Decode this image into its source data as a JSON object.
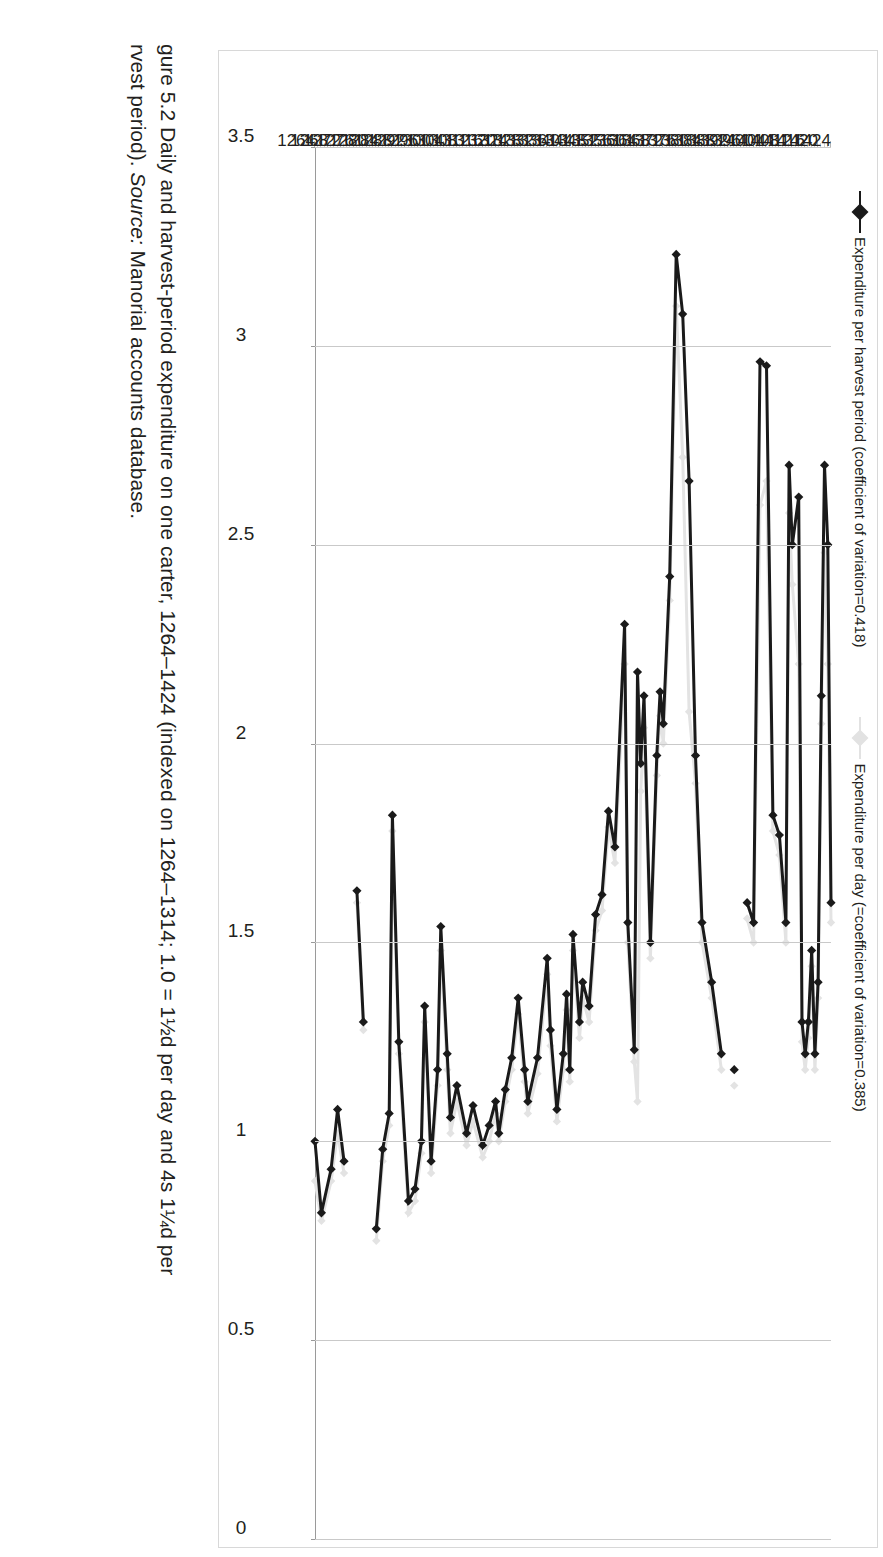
{
  "figure": {
    "caption_line1": "gure 5.2 Daily and harvest-period expenditure on one carter, 1264–1424 (indexed on 1264–1314; 1.0 = 1½d per day and 4s 1¼d per",
    "caption_line2_pre": "rvest period). ",
    "caption_source_label": "Source:",
    "caption_line2_post": " Manorial accounts database."
  },
  "chart_data": {
    "type": "line",
    "title": "",
    "xlabel": "",
    "ylabel": "",
    "orientation": "rotated-90",
    "grid": true,
    "legend_position": "top",
    "ylim": [
      0,
      3.5
    ],
    "yticks": [
      "0",
      "0.5",
      "1",
      "1.5",
      "2",
      "2.5",
      "3",
      "3.5"
    ],
    "ytick_values": [
      0,
      0.5,
      1,
      1.5,
      2,
      2.5,
      3,
      3.5
    ],
    "xlim": [
      1264,
      1424
    ],
    "xticks": [
      "1264",
      "1268",
      "1272",
      "1276",
      "1280",
      "1284",
      "1288",
      "1292",
      "1296",
      "1300",
      "1304",
      "1308",
      "1312",
      "1316",
      "1320",
      "1324",
      "1328",
      "1332",
      "1336",
      "1340",
      "1344",
      "1348",
      "1352",
      "1356",
      "1360",
      "1364",
      "1368",
      "1372",
      "1376",
      "1380",
      "1384",
      "1388",
      "1392",
      "1396",
      "1400",
      "1404",
      "1408",
      "1412",
      "1416",
      "1420",
      "1424"
    ],
    "series": [
      {
        "name": "Expenditure per harvest period (coefficient of variation=0.418)",
        "color": "#1a1a1a",
        "marker": "diamond",
        "points": [
          [
            1264,
            1.0
          ],
          [
            1266,
            0.82
          ],
          [
            1269,
            0.93
          ],
          [
            1271,
            1.08
          ],
          [
            1273,
            0.95
          ],
          [
            1277,
            1.63
          ],
          [
            1279,
            1.3
          ],
          [
            1283,
            0.78
          ],
          [
            1285,
            0.98
          ],
          [
            1287,
            1.07
          ],
          [
            1288,
            1.82
          ],
          [
            1290,
            1.25
          ],
          [
            1293,
            0.85
          ],
          [
            1295,
            0.88
          ],
          [
            1297,
            1.0
          ],
          [
            1298,
            1.34
          ],
          [
            1300,
            0.95
          ],
          [
            1302,
            1.18
          ],
          [
            1303,
            1.54
          ],
          [
            1305,
            1.22
          ],
          [
            1306,
            1.06
          ],
          [
            1308,
            1.14
          ],
          [
            1311,
            1.02
          ],
          [
            1313,
            1.09
          ],
          [
            1316,
            0.99
          ],
          [
            1318,
            1.04
          ],
          [
            1320,
            1.1
          ],
          [
            1321,
            1.02
          ],
          [
            1323,
            1.13
          ],
          [
            1325,
            1.21
          ],
          [
            1327,
            1.36
          ],
          [
            1329,
            1.18
          ],
          [
            1330,
            1.1
          ],
          [
            1333,
            1.21
          ],
          [
            1336,
            1.46
          ],
          [
            1337,
            1.28
          ],
          [
            1339,
            1.08
          ],
          [
            1341,
            1.22
          ],
          [
            1342,
            1.37
          ],
          [
            1343,
            1.18
          ],
          [
            1344,
            1.52
          ],
          [
            1346,
            1.3
          ],
          [
            1347,
            1.4
          ],
          [
            1349,
            1.34
          ],
          [
            1351,
            1.57
          ],
          [
            1353,
            1.62
          ],
          [
            1355,
            1.83
          ],
          [
            1357,
            1.74
          ],
          [
            1360,
            2.3
          ],
          [
            1361,
            1.55
          ],
          [
            1363,
            1.23
          ],
          [
            1364,
            2.18
          ],
          [
            1365,
            1.95
          ],
          [
            1366,
            2.12
          ],
          [
            1368,
            1.5
          ],
          [
            1370,
            1.97
          ],
          [
            1371,
            2.13
          ],
          [
            1372,
            2.05
          ],
          [
            1374,
            2.42
          ],
          [
            1376,
            3.23
          ],
          [
            1378,
            3.08
          ],
          [
            1380,
            2.66
          ],
          [
            1382,
            1.97
          ],
          [
            1384,
            1.55
          ],
          [
            1387,
            1.4
          ],
          [
            1390,
            1.22
          ],
          [
            1394,
            1.18
          ],
          [
            1398,
            1.6
          ],
          [
            1400,
            1.55
          ],
          [
            1402,
            2.96
          ],
          [
            1404,
            2.95
          ],
          [
            1406,
            1.82
          ],
          [
            1408,
            1.77
          ],
          [
            1410,
            1.55
          ],
          [
            1411,
            2.7
          ],
          [
            1412,
            2.5
          ],
          [
            1414,
            2.62
          ],
          [
            1415,
            1.3
          ],
          [
            1416,
            1.22
          ],
          [
            1417,
            1.3
          ],
          [
            1418,
            1.48
          ],
          [
            1419,
            1.22
          ],
          [
            1420,
            1.4
          ],
          [
            1421,
            2.12
          ],
          [
            1422,
            2.7
          ],
          [
            1423,
            2.5
          ],
          [
            1424,
            1.6
          ]
        ]
      },
      {
        "name": "Expenditure per day (=coefficient of variation=0.385)",
        "color": "#e3e3e3",
        "marker": "diamond",
        "points": [
          [
            1264,
            0.9
          ],
          [
            1266,
            0.8
          ],
          [
            1269,
            0.9
          ],
          [
            1271,
            1.02
          ],
          [
            1273,
            0.92
          ],
          [
            1277,
            1.6
          ],
          [
            1279,
            1.28
          ],
          [
            1283,
            0.75
          ],
          [
            1285,
            0.95
          ],
          [
            1287,
            1.04
          ],
          [
            1288,
            1.78
          ],
          [
            1290,
            1.22
          ],
          [
            1293,
            0.82
          ],
          [
            1295,
            0.85
          ],
          [
            1297,
            0.97
          ],
          [
            1298,
            1.3
          ],
          [
            1300,
            0.92
          ],
          [
            1302,
            1.14
          ],
          [
            1303,
            1.48
          ],
          [
            1305,
            1.18
          ],
          [
            1306,
            1.02
          ],
          [
            1308,
            1.1
          ],
          [
            1311,
            0.99
          ],
          [
            1313,
            1.05
          ],
          [
            1316,
            0.96
          ],
          [
            1318,
            1.0
          ],
          [
            1320,
            1.07
          ],
          [
            1321,
            1.0
          ],
          [
            1323,
            1.1
          ],
          [
            1325,
            1.18
          ],
          [
            1327,
            1.32
          ],
          [
            1329,
            1.15
          ],
          [
            1330,
            1.07
          ],
          [
            1333,
            1.17
          ],
          [
            1336,
            1.42
          ],
          [
            1337,
            1.24
          ],
          [
            1339,
            1.05
          ],
          [
            1341,
            1.18
          ],
          [
            1342,
            1.33
          ],
          [
            1343,
            1.15
          ],
          [
            1344,
            1.48
          ],
          [
            1346,
            1.26
          ],
          [
            1347,
            1.36
          ],
          [
            1349,
            1.3
          ],
          [
            1351,
            1.53
          ],
          [
            1353,
            1.58
          ],
          [
            1355,
            1.79
          ],
          [
            1357,
            1.7
          ],
          [
            1360,
            2.2
          ],
          [
            1361,
            1.5
          ],
          [
            1363,
            1.2
          ],
          [
            1364,
            1.1
          ],
          [
            1365,
            1.88
          ],
          [
            1366,
            2.04
          ],
          [
            1368,
            1.46
          ],
          [
            1370,
            1.92
          ],
          [
            1371,
            2.07
          ],
          [
            1372,
            2.0
          ],
          [
            1374,
            2.36
          ],
          [
            1376,
            3.1
          ],
          [
            1378,
            2.72
          ],
          [
            1380,
            2.08
          ],
          [
            1382,
            1.9
          ],
          [
            1384,
            1.5
          ],
          [
            1387,
            1.36
          ],
          [
            1390,
            1.18
          ],
          [
            1394,
            1.14
          ],
          [
            1398,
            1.56
          ],
          [
            1400,
            1.5
          ],
          [
            1402,
            2.6
          ],
          [
            1404,
            2.66
          ],
          [
            1406,
            1.78
          ],
          [
            1408,
            1.72
          ],
          [
            1410,
            1.5
          ],
          [
            1411,
            2.58
          ],
          [
            1412,
            2.4
          ],
          [
            1414,
            2.2
          ],
          [
            1415,
            1.25
          ],
          [
            1416,
            1.18
          ],
          [
            1417,
            1.26
          ],
          [
            1418,
            1.44
          ],
          [
            1419,
            1.18
          ],
          [
            1420,
            1.36
          ],
          [
            1421,
            2.05
          ],
          [
            1422,
            2.48
          ],
          [
            1423,
            2.2
          ],
          [
            1424,
            1.55
          ]
        ]
      }
    ],
    "legend": [
      {
        "label": "Expenditure per harvest period (coefficient of variation=0.418)",
        "color": "#1a1a1a"
      },
      {
        "label": "Expenditure per day (=coefficient of variation=0.385)",
        "color": "#e3e3e3"
      }
    ]
  }
}
